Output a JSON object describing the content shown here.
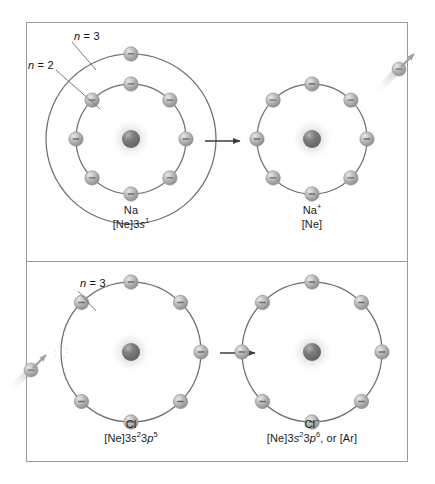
{
  "figure": {
    "background_color": "#ffffff",
    "frame_color": "#9a9a9a",
    "orbit_color": "#6e6e6e",
    "electron_color": "#a8a8a8",
    "nucleus_color": "#6b6b6b",
    "arrow_color": "#3c3c3c"
  },
  "panels": [
    {
      "id": "sodium-panel",
      "left": {
        "id": "na-atom",
        "symbol": "Na",
        "configuration_prefix": "[Ne]3",
        "configuration_orbital": "s",
        "configuration_exponent": "1",
        "configuration_plain": "[Ne]3s1",
        "shell_labels": [
          {
            "text_n": "n",
            "text_eq": "= 3",
            "full": "n = 3"
          },
          {
            "text_n": "n",
            "text_eq": "= 2",
            "full": "n = 2"
          }
        ],
        "shells": [
          {
            "name": "n=3",
            "radius": 85,
            "electrons": 1,
            "electron_angles": [
              -90
            ]
          },
          {
            "name": "n=2",
            "radius": 55,
            "electrons": 8,
            "electron_angles": [
              -90,
              -45,
              0,
              45,
              90,
              135,
              180,
              -135
            ]
          }
        ]
      },
      "right": {
        "id": "na-ion",
        "symbol": "Na",
        "charge": "+",
        "configuration_plain": "[Ne]",
        "shells": [
          {
            "name": "n=2",
            "radius": 55,
            "electrons": 8,
            "electron_angles": [
              -90,
              -45,
              0,
              45,
              90,
              135,
              180,
              -135
            ]
          }
        ]
      },
      "reaction_arrow": "→",
      "moving_electron": {
        "name": "escaping-electron",
        "direction": "up-right",
        "description": "electron leaving the sodium atom"
      }
    },
    {
      "id": "chlorine-panel",
      "left": {
        "id": "cl-atom",
        "symbol": "Cl",
        "configuration_plain": "[Ne]3s23p5",
        "configuration_parts": [
          {
            "text": "[Ne]3"
          },
          {
            "text": "s",
            "italic": true
          },
          {
            "text": "2",
            "sup": true
          },
          {
            "text": "3"
          },
          {
            "text": "p",
            "italic": true
          },
          {
            "text": "5",
            "sup": true
          }
        ],
        "shell_labels": [
          {
            "text_n": "n",
            "text_eq": "= 3",
            "full": "n = 3"
          }
        ],
        "shells": [
          {
            "name": "n=3",
            "radius": 70,
            "electrons": 7,
            "electron_angles": [
              -90,
              -45,
              0,
              45,
              90,
              135,
              -135
            ]
          }
        ]
      },
      "right": {
        "id": "cl-ion",
        "symbol": "Cl",
        "charge": "−",
        "configuration_plain": "[Ne]3s23p6, or [Ar]",
        "configuration_parts": [
          {
            "text": "[Ne]3"
          },
          {
            "text": "s",
            "italic": true
          },
          {
            "text": "2",
            "sup": true
          },
          {
            "text": "3"
          },
          {
            "text": "p",
            "italic": true
          },
          {
            "text": "6",
            "sup": true
          },
          {
            "text": ", or [Ar]"
          }
        ],
        "shells": [
          {
            "name": "n=3",
            "radius": 70,
            "electrons": 8,
            "electron_angles": [
              -90,
              -45,
              0,
              45,
              90,
              135,
              180,
              -135
            ]
          }
        ]
      },
      "reaction_arrow": "→",
      "moving_electron": {
        "name": "incoming-electron",
        "direction": "up-right",
        "description": "electron approaching the chlorine atom"
      }
    }
  ],
  "labels": {
    "na_shell_n3": "n = 3",
    "na_shell_n2": "n = 2",
    "cl_shell_n3": "n = 3",
    "na_symbol": "Na",
    "na_config": "[Ne]3s",
    "na_config_sup": "1",
    "na_ion_symbol": "Na",
    "na_ion_sup": "+",
    "na_ion_config": "[Ne]",
    "cl_symbol": "Cl",
    "cl_ion_symbol": "Cl",
    "cl_ion_sup": "−",
    "arrow_glyph": "→"
  }
}
